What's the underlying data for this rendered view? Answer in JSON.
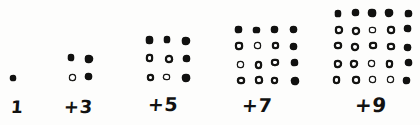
{
  "figure": {
    "background_color": "#fdfdfc",
    "ink_color": "#121211",
    "width": 420,
    "height": 125
  },
  "groups": [
    {
      "id": "group-1",
      "label": "1",
      "label_x": 11,
      "label_y": 99,
      "label_size": 17,
      "grid_size": 1,
      "origin_x": 9,
      "origin_y": 76,
      "step_x": 18,
      "step_y": 17,
      "dot_size": 6,
      "new_count": 1,
      "old_count": 0,
      "total": 1
    },
    {
      "id": "group-3",
      "label": "+3",
      "label_x": 64,
      "label_y": 98,
      "label_size": 18,
      "grid_size": 2,
      "origin_x": 68,
      "origin_y": 54,
      "step_x": 17,
      "step_y": 19,
      "dot_size": 7,
      "new_count": 3,
      "old_count": 1,
      "total": 4
    },
    {
      "id": "group-5",
      "label": "+5",
      "label_x": 148,
      "label_y": 95,
      "label_size": 19,
      "grid_size": 3,
      "origin_x": 146,
      "origin_y": 36,
      "step_x": 18,
      "step_y": 19,
      "dot_size": 7.5,
      "new_count": 5,
      "old_count": 4,
      "total": 9
    },
    {
      "id": "group-7",
      "label": "+7",
      "label_x": 242,
      "label_y": 96,
      "label_size": 19,
      "grid_size": 4,
      "origin_x": 236,
      "origin_y": 26,
      "step_x": 18,
      "step_y": 17,
      "dot_size": 7.5,
      "new_count": 7,
      "old_count": 9,
      "total": 16
    },
    {
      "id": "group-9",
      "label": "+9",
      "label_x": 355,
      "label_y": 95,
      "label_size": 20,
      "grid_size": 5,
      "origin_x": 334,
      "origin_y": 9,
      "step_x": 17.5,
      "step_y": 16.8,
      "dot_size": 7.5,
      "new_count": 9,
      "old_count": 16,
      "total": 25
    }
  ],
  "legend": {
    "filled_meaning": "newly added odd number of dots",
    "hollow_meaning": "dots carried over from the previous square"
  },
  "chart_data": {
    "type": "diagram",
    "categories": [
      "1",
      "+3",
      "+5",
      "+7",
      "+9"
    ],
    "added_values": [
      1,
      3,
      5,
      7,
      9
    ],
    "cumulative_totals": [
      1,
      4,
      9,
      16,
      25
    ],
    "square_sides": [
      1,
      2,
      3,
      4,
      5
    ]
  }
}
